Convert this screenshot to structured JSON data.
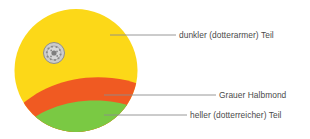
{
  "figure": {
    "background_color": "#ffffff"
  },
  "diagram": {
    "shape": "circle",
    "center_x": 76,
    "center_y": 70.5,
    "radius": 61.5,
    "regions": [
      {
        "id": "dark-yolk",
        "name": "dunkler (dotterarmer) Teil",
        "color": "#FCD818"
      },
      {
        "id": "grey-crescent",
        "name": "Grauer Halbmond",
        "color": "#F05A22"
      },
      {
        "id": "light-yolk",
        "name": "heller (dotterreicher) Teil",
        "color": "#7AC943"
      }
    ],
    "germinal_disc": {
      "name": "Keimscheibe",
      "center_x": 54,
      "center_y": 53,
      "radius": 11,
      "fill_color": "#C9C9C9",
      "stroke_color": "#8A8A8A"
    }
  },
  "callouts": [
    {
      "id": "dark",
      "label": "dunkler (dotterarmer) Teil",
      "leader_x1": 110,
      "leader_x2": 176,
      "leader_y": 35,
      "color": "#8c8c8c"
    },
    {
      "id": "crescent",
      "label": "Grauer Halbmond",
      "leader_x1": 104,
      "leader_x2": 216,
      "leader_y": 95,
      "color": "#8c8c8c"
    },
    {
      "id": "light",
      "label": "heller (dotterreicher) Teil",
      "leader_x1": 104,
      "leader_x2": 187,
      "leader_y": 115,
      "color": "#8c8c8c"
    }
  ]
}
